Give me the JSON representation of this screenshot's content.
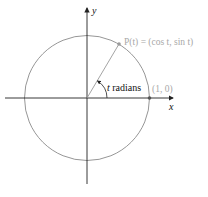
{
  "diagram": {
    "type": "unit-circle",
    "axes": {
      "x_label": "x",
      "y_label": "y"
    },
    "point_p_label": "P(t) = (cos t, sin t)",
    "angle_label_var": "t",
    "angle_label_word": " radians",
    "point_start_label": "(1, 0)",
    "colors": {
      "axis": "#222222",
      "circle": "#8a8a8a",
      "radius": "#9a9a9a",
      "gray_label": "#a8a8a8",
      "text": "#111111"
    }
  }
}
